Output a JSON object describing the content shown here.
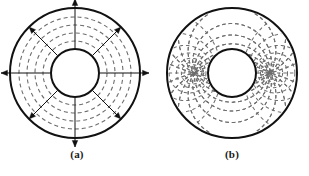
{
  "figure": {
    "background_color": "#ffffff",
    "stroke_color": "#111111",
    "dashed_color": "#6e6e6e",
    "panels": [
      {
        "id": "a",
        "caption": "(a)",
        "description": "Coaxial cable cross-section with radial electric field lines",
        "center_x": 75,
        "center_y": 73,
        "outer_radius": 65,
        "inner_radius": 24,
        "outer_line_width": 2.0,
        "inner_line_width": 2.0,
        "field_type": "radial-arrows",
        "arrow_count": 8,
        "arrow_angles_deg": [
          0,
          45,
          90,
          135,
          180,
          225,
          270,
          315
        ],
        "arrow_length": 74,
        "dashed_circle_count": 4,
        "dashed_circle_radii": [
          32,
          40,
          48,
          56
        ],
        "dash_pattern": "4 3"
      },
      {
        "id": "b",
        "caption": "(b)",
        "description": "Coaxial cable cross-section with two-dimensional dipole-like flux mapping",
        "center_x": 77,
        "center_y": 73,
        "outer_radius": 65,
        "inner_radius": 24,
        "outer_line_width": 2.0,
        "inner_line_width": 2.0,
        "field_type": "bipolar-curvilinear-grid",
        "pole_left_x": -38,
        "pole_right_x": 38,
        "flux_line_count": 24,
        "equipotential_count": 7,
        "dash_pattern": "3.5 3"
      }
    ]
  }
}
